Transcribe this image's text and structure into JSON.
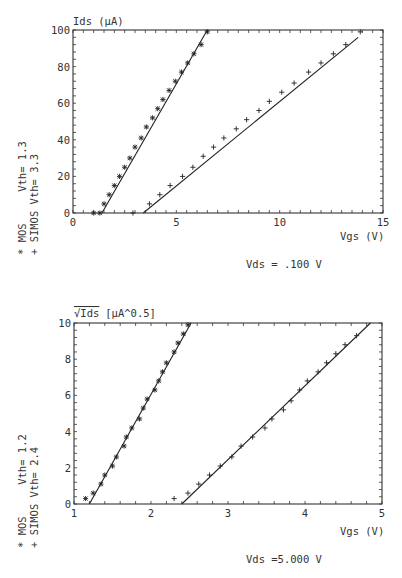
{
  "chart_data": [
    {
      "type": "scatter",
      "title": "",
      "ylabel": "Ids (µA)",
      "xlabel": "Vgs (V)",
      "annotation": "Vds = .100 V",
      "xlim": [
        0,
        15
      ],
      "ylim": [
        0,
        100
      ],
      "xticks": [
        "0",
        "5",
        "10",
        "15"
      ],
      "yticks": [
        "0",
        "20",
        "40",
        "60",
        "80",
        "100"
      ],
      "legend": [
        "* MOS     Vth= 1.3",
        "+ SIMOS Vth= 3.3"
      ],
      "legend_position": "left-rotated",
      "series": [
        {
          "name": "MOS",
          "marker": "*",
          "vth": 1.3,
          "x": [
            1.0,
            1.3,
            1.5,
            1.75,
            2.0,
            2.25,
            2.5,
            2.75,
            3.0,
            3.3,
            3.55,
            3.85,
            4.1,
            4.35,
            4.65,
            4.95,
            5.25,
            5.55,
            5.85,
            6.2,
            6.5
          ],
          "y": [
            0,
            0,
            5,
            10,
            15,
            20,
            25,
            30,
            36,
            41,
            47,
            52,
            57,
            62,
            67,
            72,
            77,
            82,
            87,
            92,
            99
          ],
          "fit_line": {
            "x": [
              1.4,
              6.5
            ],
            "y": [
              0,
              100
            ]
          }
        },
        {
          "name": "SIMOS",
          "marker": "+",
          "vth": 3.3,
          "x": [
            2.9,
            3.7,
            4.2,
            4.7,
            5.3,
            5.8,
            6.3,
            6.8,
            7.3,
            7.9,
            8.4,
            9.0,
            9.5,
            10.1,
            10.7,
            11.4,
            12.0,
            12.6,
            13.2,
            13.9
          ],
          "y": [
            0,
            5,
            10,
            15,
            20,
            25,
            31,
            36,
            41,
            46,
            51,
            56,
            61,
            66,
            71,
            77,
            82,
            87,
            92,
            99
          ],
          "fit_line": {
            "x": [
              3.4,
              13.8
            ],
            "y": [
              0,
              96
            ]
          }
        }
      ]
    },
    {
      "type": "scatter",
      "title": "",
      "ylabel": "√Ids [µA^0.5]",
      "xlabel": "Vgs (V)",
      "annotation": "Vds =5.000 V",
      "xlim": [
        1,
        5
      ],
      "ylim": [
        0,
        10
      ],
      "xticks": [
        "1",
        "2",
        "3",
        "4",
        "5"
      ],
      "yticks": [
        "0",
        "2",
        "4",
        "6",
        "8",
        "10"
      ],
      "legend": [
        "* MOS     Vth= 1.2",
        "+ SIMOS Vth= 2.4"
      ],
      "legend_position": "left-rotated",
      "series": [
        {
          "name": "MOS",
          "marker": "*",
          "vth": 1.2,
          "x": [
            1.15,
            1.25,
            1.35,
            1.4,
            1.5,
            1.55,
            1.65,
            1.68,
            1.75,
            1.85,
            1.9,
            1.95,
            2.05,
            2.1,
            2.15,
            2.2,
            2.3,
            2.35,
            2.42,
            2.48
          ],
          "y": [
            0.3,
            0.6,
            1.1,
            1.6,
            2.1,
            2.6,
            3.2,
            3.7,
            4.2,
            4.7,
            5.3,
            5.8,
            6.3,
            6.8,
            7.3,
            7.8,
            8.4,
            8.9,
            9.4,
            9.9
          ],
          "fit_line": {
            "x": [
              1.2,
              2.52
            ],
            "y": [
              0,
              10
            ]
          }
        },
        {
          "name": "SIMOS",
          "marker": "+",
          "vth": 2.4,
          "x": [
            2.3,
            2.48,
            2.62,
            2.76,
            2.9,
            3.05,
            3.17,
            3.32,
            3.48,
            3.57,
            3.72,
            3.82,
            3.93,
            4.03,
            4.17,
            4.28,
            4.4,
            4.52,
            4.67
          ],
          "y": [
            0.3,
            0.6,
            1.1,
            1.6,
            2.1,
            2.6,
            3.2,
            3.7,
            4.2,
            4.7,
            5.2,
            5.7,
            6.3,
            6.8,
            7.3,
            7.8,
            8.3,
            8.8,
            9.3
          ],
          "fit_line": {
            "x": [
              2.4,
              4.85
            ],
            "y": [
              0,
              10
            ]
          }
        }
      ]
    }
  ],
  "plots": [
    {
      "ylabel": "Ids (µA)",
      "xlabel": "Vgs (V)",
      "annotation": "Vds = .100 V",
      "legend_mos": "* MOS     Vth= 1.3",
      "legend_simos": "+ SIMOS Vth= 3.3"
    },
    {
      "ylabel_root": "√Ids",
      "ylabel_units": "[µA^0.5]",
      "xlabel": "Vgs (V)",
      "annotation": "Vds =5.000 V",
      "legend_mos": "* MOS     Vth= 1.2",
      "legend_simos": "+ SIMOS Vth= 2.4"
    }
  ]
}
